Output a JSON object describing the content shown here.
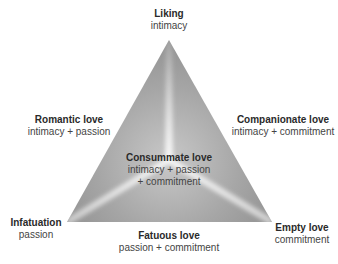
{
  "diagram": {
    "type": "triangular-theory-of-love",
    "vertices": {
      "top": {
        "title": "Liking",
        "sub": "intimacy"
      },
      "bottom_left": {
        "title": "Infatuation",
        "sub": "passion"
      },
      "bottom_right": {
        "title": "Empty love",
        "sub": "commitment"
      }
    },
    "edges": {
      "left": {
        "title": "Romantic love",
        "sub": "intimacy + passion"
      },
      "right": {
        "title": "Companionate love",
        "sub": "intimacy + commitment"
      },
      "bottom": {
        "title": "Fatuous love",
        "sub": "passion + commitment"
      }
    },
    "center": {
      "title": "Consummate love",
      "sub_line1": "intimacy + passion",
      "sub_line2": "+ commitment"
    },
    "colors": {
      "triangle_dark": "#8e8e8e",
      "triangle_light": "#f2f2f2",
      "text": "#333333"
    }
  }
}
